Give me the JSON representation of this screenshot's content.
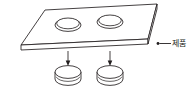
{
  "figure": {
    "type": "isometric-technical-diagram",
    "background_color": "#ffffff",
    "line_color": "#231f20",
    "annotations": [
      {
        "id": "product",
        "text": "제품",
        "leader": "dot-and-horizontal-line-pointing-left",
        "target": "plate-edge"
      }
    ],
    "parts": {
      "plate": {
        "name": "plate",
        "holes": 2,
        "thickness_shown": true
      },
      "slugs": [
        {
          "name": "slug-left"
        },
        {
          "name": "slug-right"
        }
      ],
      "arrows": [
        {
          "name": "arrow-left",
          "direction": "down"
        },
        {
          "name": "arrow-right",
          "direction": "down"
        }
      ]
    }
  },
  "labels": {
    "product": "제품"
  }
}
